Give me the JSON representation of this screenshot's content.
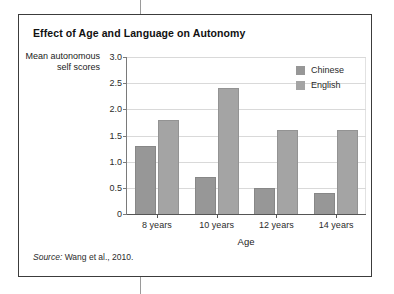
{
  "figure": {
    "title": "Effect of Age and Language on Autonomy",
    "source_key": "Source:",
    "source_value": " Wang et al., 2010."
  },
  "chart_data": {
    "type": "bar",
    "title": "Effect of Age and Language on Autonomy",
    "xlabel": "Age",
    "ylabel": "Mean autonomous self scores",
    "categories": [
      "8 years",
      "10 years",
      "12 years",
      "14 years"
    ],
    "series": [
      {
        "name": "Chinese",
        "color": "#979797",
        "values": [
          1.3,
          0.7,
          0.5,
          0.4
        ]
      },
      {
        "name": "English",
        "color": "#a4a4a4",
        "values": [
          1.8,
          2.4,
          1.6,
          1.6
        ]
      }
    ],
    "ylim": [
      0,
      3.0
    ],
    "yticks": [
      "0",
      "0.5",
      "1.0",
      "1.5",
      "2.0",
      "2.5",
      "3.0"
    ],
    "ytick_values": [
      0,
      0.5,
      1.0,
      1.5,
      2.0,
      2.5,
      3.0
    ],
    "grid": true,
    "legend_position": "top-right"
  }
}
